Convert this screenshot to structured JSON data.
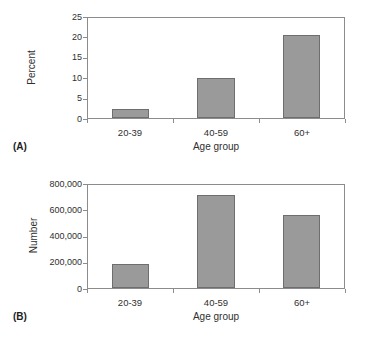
{
  "figure": {
    "panels": [
      {
        "tag": "(A)",
        "chart_data": {
          "type": "bar",
          "title": "",
          "categories": [
            "20-39",
            "40-59",
            "60+"
          ],
          "values": [
            2.2,
            10.0,
            20.7
          ],
          "xlabel": "Age group",
          "ylabel": "Percent",
          "ylim": [
            0,
            25
          ],
          "yticks": [
            25,
            20,
            15,
            10,
            5,
            0
          ],
          "ytick_labels": [
            "25",
            "20",
            "15",
            "10",
            "5",
            "0"
          ],
          "grid": false,
          "legend": "none",
          "bar_color": "#9a9a9a",
          "bar_border_color": "#6e6e6e"
        }
      },
      {
        "tag": "(B)",
        "chart_data": {
          "type": "bar",
          "title": "",
          "categories": [
            "20-39",
            "40-59",
            "60+"
          ],
          "values": [
            190000,
            725000,
            570000
          ],
          "xlabel": "Age group",
          "ylabel": "Number",
          "ylim": [
            0,
            800000
          ],
          "yticks": [
            800000,
            600000,
            400000,
            200000,
            0
          ],
          "ytick_labels": [
            "800,000",
            "600,000",
            "400,000",
            "200,000",
            "0"
          ],
          "grid": false,
          "legend": "none",
          "bar_color": "#9a9a9a",
          "bar_border_color": "#6e6e6e"
        }
      }
    ]
  }
}
